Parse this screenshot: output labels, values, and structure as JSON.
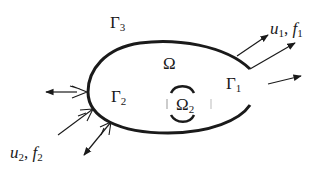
{
  "labels": {
    "gamma3": {
      "base": "Γ",
      "sub": "3"
    },
    "gamma2": {
      "base": "Γ",
      "sub": "2"
    },
    "gamma1": {
      "base": "Γ",
      "sub": "1"
    },
    "omega": {
      "base": "Ω"
    },
    "omega2": {
      "base": "Ω",
      "sub": "2"
    },
    "u1f1": {
      "u": "u",
      "u_sub": "1",
      "sep": ", ",
      "f": "f",
      "f_sub": "1"
    },
    "u2f2": {
      "u": "u",
      "u_sub": "2",
      "sep": ", ",
      "f": "f",
      "f_sub": "2"
    }
  },
  "colors": {
    "stroke": "#1a1a1a",
    "background": "#ffffff"
  }
}
